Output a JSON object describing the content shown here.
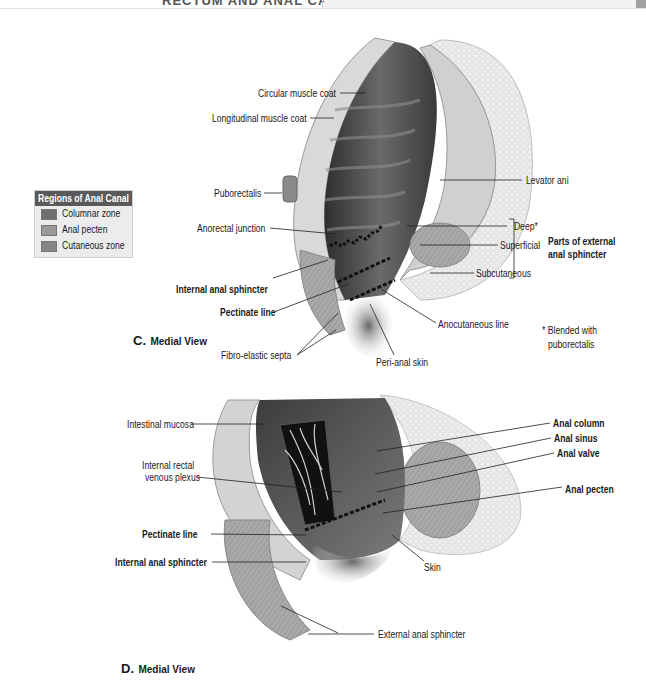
{
  "header": {
    "title": "RECTUM AND ANAL CANAL"
  },
  "legend": {
    "title": "Regions of Anal Canal",
    "items": [
      {
        "label": "Columnar zone",
        "color": "#6e6e6e"
      },
      {
        "label": "Anal pecten",
        "color": "#9a9a9a"
      },
      {
        "label": "Cutaneous zone",
        "color": "#858585"
      }
    ]
  },
  "figure_c": {
    "view_letter": "C.",
    "view_label": "Medial View",
    "labels": {
      "circular_muscle_coat": "Circular muscle coat",
      "longitudinal_muscle_coat": "Longitudinal muscle coat",
      "puborectalis": "Puborectalis",
      "anorectal_junction": "Anorectal junction",
      "internal_anal_sphincter": "Internal anal sphincter",
      "pectinate_line": "Pectinate line",
      "fibro_elastic_septa": "Fibro-elastic septa",
      "peri_anal_skin": "Peri-anal skin",
      "anocutaneous_line": "Anocutaneous line",
      "levator_ani": "Levator ani",
      "deep": "Deep*",
      "superficial": "Superficial",
      "subcutaneous": "Subcutaneous",
      "parts_of_external_line1": "Parts of external",
      "parts_of_external_line2": "anal sphincter",
      "footnote_line1": "* Blended with",
      "footnote_line2": "puborectalis"
    }
  },
  "figure_d": {
    "view_letter": "D.",
    "view_label": "Medial View",
    "labels": {
      "intestinal_mucosa": "Intestinal mucosa",
      "internal_rectal_line1": "Internal rectal",
      "internal_rectal_line2": "venous plexus",
      "pectinate_line": "Pectinate line",
      "internal_anal_sphincter": "Internal anal sphincter",
      "anal_column": "Anal column",
      "anal_sinus": "Anal sinus",
      "anal_valve": "Anal valve",
      "anal_pecten": "Anal pecten",
      "skin": "Skin",
      "external_anal_sphincter": "External anal sphincter"
    }
  }
}
